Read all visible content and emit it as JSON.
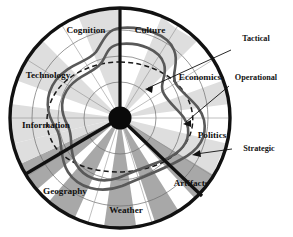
{
  "figure": {
    "background_color": "#ffffff",
    "center": {
      "x": 120,
      "y": 118
    },
    "outer_radius": 111,
    "hub_radius": 11.5,
    "grid_radii": [
      36,
      62,
      88
    ]
  },
  "sectors": [
    {
      "id": "cognition",
      "label": "Cognition",
      "label_x": 86,
      "label_y": 31,
      "anchor": "middle"
    },
    {
      "id": "culture",
      "label": "Culture",
      "label_x": 150,
      "label_y": 31,
      "anchor": "middle"
    },
    {
      "id": "economics",
      "label": "Economics",
      "label_x": 200,
      "label_y": 78,
      "anchor": "middle"
    },
    {
      "id": "politics",
      "label": "Politics",
      "label_x": 212,
      "label_y": 136,
      "anchor": "middle"
    },
    {
      "id": "artifacts",
      "label": "Artifacts",
      "label_x": 191,
      "label_y": 184,
      "anchor": "middle"
    },
    {
      "id": "weather",
      "label": "Weather",
      "label_x": 126,
      "label_y": 211,
      "anchor": "middle"
    },
    {
      "id": "geography",
      "label": "Geography",
      "label_x": 65,
      "label_y": 192,
      "anchor": "middle"
    },
    {
      "id": "information",
      "label": "Information",
      "label_x": 46,
      "label_y": 126,
      "anchor": "middle"
    },
    {
      "id": "technology",
      "label": "Technology",
      "label_x": 48,
      "label_y": 76,
      "anchor": "middle"
    }
  ],
  "annotations": [
    {
      "id": "tactical",
      "label": "Tactical",
      "label_x": 256,
      "label_y": 39,
      "anchor": "middle",
      "leader": "M231,50 L148,88",
      "arrow_tip": {
        "x": 145,
        "y": 89
      },
      "arrow_angle": 205
    },
    {
      "id": "operational",
      "label": "Operational",
      "label_x": 256,
      "label_y": 78,
      "anchor": "middle",
      "leader": "M229,86 L186,122",
      "arrow_tip": {
        "x": 183,
        "y": 124
      },
      "arrow_angle": 220
    },
    {
      "id": "strategic",
      "label": "Strategic",
      "label_x": 259,
      "label_y": 149,
      "anchor": "middle",
      "leader": "M232,149 L196,154",
      "arrow_tip": {
        "x": 192,
        "y": 155
      },
      "arrow_angle": 188
    }
  ],
  "chart_data": {
    "type": "radar",
    "title": "",
    "xlabel": "",
    "ylabel": "",
    "grid": true,
    "legend_position": "right-annotations",
    "axes": [
      "Cognition",
      "Culture",
      "Economics",
      "Politics",
      "Artifacts",
      "Weather",
      "Geography",
      "Information",
      "Technology"
    ],
    "radial_range": [
      0,
      1
    ],
    "grid_levels": [
      0.33,
      0.56,
      0.79
    ],
    "series": [
      {
        "name": "Tactical",
        "style": "solid",
        "color": "#595959",
        "width": 2.6,
        "values": [
          0.8,
          0.82,
          0.74,
          0.8,
          0.72,
          0.7,
          0.74,
          0.78,
          0.62
        ],
        "path": "M 120 28 C 142 26 168 34 174 50 C 180 64 170 74 176 84 C 186 98 200 104 204 120 C 208 140 196 152 180 160 C 162 170 140 178 122 186 C 100 194 78 188 68 172 C 58 156 64 140 56 128 C 46 114 44 96 56 80 C 68 64 88 62 96 52 C 104 40 106 30 120 28 Z"
      },
      {
        "name": "Operational",
        "style": "solid",
        "color": "#595959",
        "width": 2.6,
        "values": [
          0.62,
          0.66,
          0.56,
          0.64,
          0.55,
          0.52,
          0.57,
          0.6,
          0.46
        ],
        "path": "M 120 44 C 140 42 160 50 164 64 C 168 76 158 84 164 94 C 172 108 186 114 188 128 C 190 144 178 154 164 160 C 148 166 132 172 118 178 C 100 184 84 178 76 164 C 68 150 74 138 68 126 C 60 112 60 98 70 86 C 80 74 96 72 102 62 C 108 52 108 46 120 44 Z"
      },
      {
        "name": "Strategic",
        "style": "dashed",
        "color": "#1a1a1a",
        "width": 1.5,
        "values": [
          0.5,
          0.52,
          0.5,
          0.52,
          0.5,
          0.48,
          0.5,
          0.52,
          0.48
        ],
        "path": "M 120 62 C 146 62 172 74 184 92 C 196 110 196 132 182 148 C 168 164 142 172 118 172 C 94 172 68 164 56 148 C 44 132 44 110 56 92 C 68 74 94 62 120 62 Z"
      }
    ]
  },
  "wedges": {
    "note": "alternating pale and mid gray radial bands",
    "light_color": "#dedede",
    "dark_color": "#a8a8a8",
    "white_color": "#ffffff"
  }
}
